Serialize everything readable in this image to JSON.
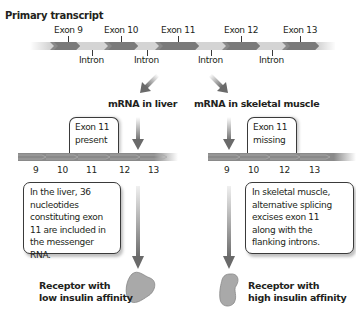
{
  "title": "Primary transcript",
  "primary_transcript": {
    "exons": [
      "Exon 9",
      "Exon 10",
      "Exon 11",
      "Exon 12",
      "Exon 13"
    ],
    "introns": [
      "Intron",
      "Intron",
      "Intron",
      "Intron"
    ]
  },
  "branches": {
    "liver": {
      "title": "mRNA in liver",
      "callout_top": "Exon 11 present",
      "callout_top_lines": [
        "Exon 11",
        "present"
      ],
      "exon_numbers": [
        "9",
        "10",
        "11",
        "12",
        "13"
      ],
      "callout_bottom_lines": [
        "In the liver, 36",
        "nucleotides",
        "constituting exon",
        "11 are included in",
        "the messenger RNA."
      ],
      "receptor_lines": [
        "Receptor with",
        "low insulin affinity"
      ]
    },
    "muscle": {
      "title": "mRNA in skeletal muscle",
      "callout_top_lines": [
        "Exon 11",
        "missing"
      ],
      "exon_numbers": [
        "9",
        "10",
        "12",
        "13"
      ],
      "callout_bottom_lines": [
        "In skeletal muscle,",
        "alternative splicing",
        "excises exon 11",
        "along with the",
        "flanking introns."
      ],
      "receptor_lines": [
        "Receptor with",
        "high insulin affinity"
      ]
    }
  },
  "colors": {
    "exon": "#7a7a7a",
    "intron": "#d4d4d4",
    "receptor": "#a9a9a9",
    "arrow": "#6a6a6a"
  }
}
